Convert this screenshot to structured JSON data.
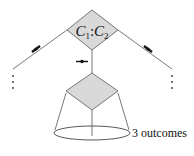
{
  "diagram": {
    "top_node": {
      "label_c1": "C",
      "sub1": "1",
      "sep": ":",
      "label_c2": "C",
      "sub2": "2",
      "fill": "#d9d9d9"
    },
    "bottom_node": {
      "fill": "#d9d9d9"
    },
    "outcomes_label": "3 outcomes",
    "ellipsis_left": "⋮",
    "ellipsis_right": "⋮",
    "line_color": "#555555"
  }
}
